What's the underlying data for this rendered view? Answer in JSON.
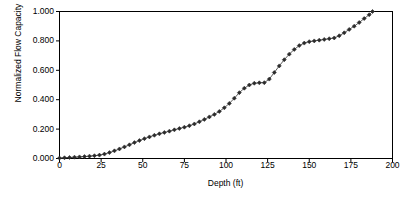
{
  "chart_data": {
    "type": "line",
    "title": "",
    "xlabel": "Depth (ft)",
    "ylabel": "Normalized Flow Capacity",
    "xlim": [
      0,
      200
    ],
    "ylim": [
      0.0,
      1.0
    ],
    "grid": "horizontal",
    "legend": "none",
    "marker": "diamond",
    "marker_color": "#2b2b2b",
    "line_color": "#4a4a4a",
    "gridline_color": "#808080",
    "axis_color": "#000000",
    "plot_background": "#ffffff",
    "xticks": [
      0,
      25,
      50,
      75,
      100,
      125,
      150,
      175,
      200
    ],
    "xtick_labels": [
      "0",
      "25",
      "50",
      "75",
      "100",
      "125",
      "150",
      "175",
      "200"
    ],
    "yticks": [
      0.0,
      0.2,
      0.4,
      0.6,
      0.8,
      1.0
    ],
    "ytick_labels": [
      "0.000",
      "0.200",
      "0.400",
      "0.600",
      "0.800",
      "1.000"
    ],
    "x": [
      0,
      3,
      6,
      9,
      12,
      15,
      18,
      21,
      24,
      27,
      30,
      33,
      36,
      39,
      42,
      45,
      48,
      51,
      54,
      57,
      60,
      63,
      66,
      69,
      72,
      75,
      78,
      81,
      84,
      87,
      90,
      93,
      96,
      99,
      102,
      105,
      108,
      111,
      114,
      117,
      120,
      123,
      126,
      129,
      132,
      135,
      138,
      141,
      144,
      147,
      150,
      153,
      156,
      159,
      162,
      165,
      168,
      171,
      174,
      177,
      180,
      183,
      186,
      188
    ],
    "y": [
      0.003,
      0.005,
      0.007,
      0.009,
      0.011,
      0.013,
      0.016,
      0.019,
      0.023,
      0.03,
      0.04,
      0.052,
      0.065,
      0.079,
      0.093,
      0.108,
      0.122,
      0.135,
      0.147,
      0.158,
      0.168,
      0.177,
      0.186,
      0.195,
      0.204,
      0.213,
      0.223,
      0.235,
      0.25,
      0.266,
      0.283,
      0.3,
      0.32,
      0.345,
      0.375,
      0.41,
      0.448,
      0.478,
      0.5,
      0.512,
      0.515,
      0.516,
      0.54,
      0.585,
      0.63,
      0.672,
      0.71,
      0.742,
      0.768,
      0.785,
      0.795,
      0.8,
      0.805,
      0.81,
      0.815,
      0.82,
      0.835,
      0.855,
      0.878,
      0.9,
      0.925,
      0.952,
      0.978,
      1.0
    ]
  }
}
